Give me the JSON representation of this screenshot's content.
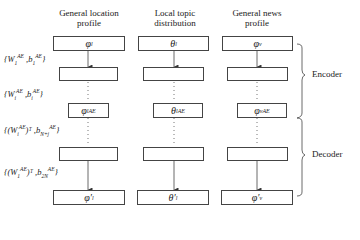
{
  "columns": [
    {
      "header_line1": "General location",
      "header_line2": "profile",
      "input": "φ",
      "input_sub": "l",
      "code": "φ",
      "code_sub": "l",
      "code_sup": "AE",
      "output": "φ′",
      "output_sub": "l"
    },
    {
      "header_line1": "Local topic",
      "header_line2": "distribution",
      "input": "θ",
      "input_sub": "l",
      "code": "θ",
      "code_sub": "l",
      "code_sup": "AE",
      "output": "θ′",
      "output_sub": "l"
    },
    {
      "header_line1": "General news",
      "header_line2": "profile",
      "input": "φ",
      "input_sub": "v",
      "code": "φ",
      "code_sub": "v",
      "code_sup": "AE",
      "output": "φ′",
      "output_sub": "v"
    }
  ],
  "layer_params": [
    {
      "open": "{",
      "w": "W",
      "w_sub": "1",
      "w_sup": "AE",
      "sep": " ,",
      "b": "b",
      "b_sub": "1",
      "b_sup": "AE",
      "close": "}"
    },
    {
      "open": "{",
      "w": "W",
      "w_sub": "i",
      "w_sup": "AE",
      "sep": " ,",
      "b": "b",
      "b_sub": "i",
      "b_sup": "AE",
      "close": "}"
    },
    {
      "open": "{(",
      "w": "W",
      "w_sub": "i",
      "w_sup": "AE",
      "trans": ")ᵀ",
      "sep": " ,",
      "b": "b",
      "b_sub": "N+j",
      "b_sup": "AE",
      "close": "}"
    },
    {
      "open": "{(",
      "w": "W",
      "w_sub": "1",
      "w_sup": "AE",
      "trans": ")ᵀ",
      "sep": " ,",
      "b": "b",
      "b_sub": "2N",
      "b_sup": "AE",
      "close": "}"
    }
  ],
  "sections": {
    "encoder": "Encoder",
    "decoder": "Decoder"
  },
  "colors": {
    "line": "#444444",
    "text": "#222222"
  }
}
